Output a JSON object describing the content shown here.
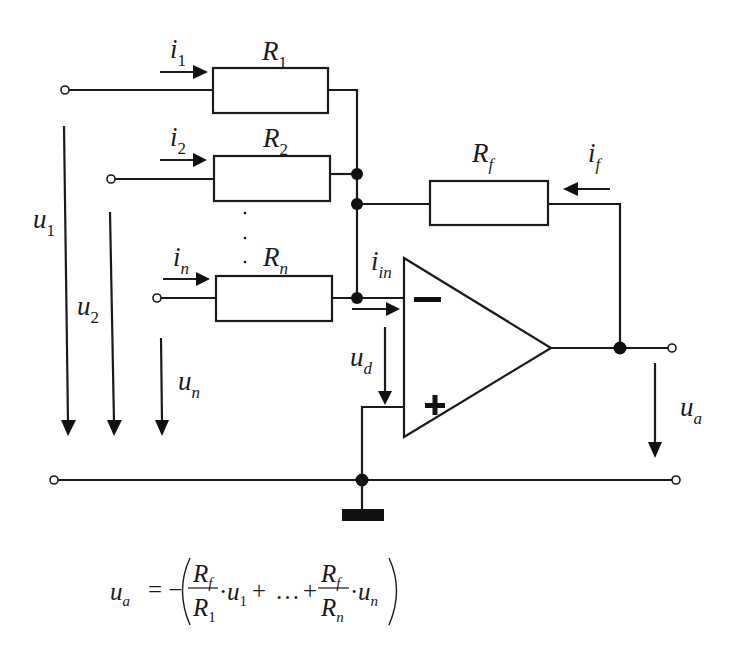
{
  "diagram": {
    "resistors": [
      {
        "id": "R1",
        "symbol": "R",
        "sub": "1",
        "current": "i",
        "current_sub": "1"
      },
      {
        "id": "R2",
        "symbol": "R",
        "sub": "2",
        "current": "i",
        "current_sub": "2"
      },
      {
        "id": "Rn",
        "symbol": "R",
        "sub": "n",
        "current": "i",
        "current_sub": "n"
      }
    ],
    "feedback": {
      "symbol": "R",
      "sub": "f",
      "current": "i",
      "current_sub": "f"
    },
    "input_current": {
      "symbol": "i",
      "sub": "in"
    },
    "voltages": [
      {
        "symbol": "u",
        "sub": "1"
      },
      {
        "symbol": "u",
        "sub": "2"
      },
      {
        "symbol": "u",
        "sub": "n"
      }
    ],
    "differential_voltage": {
      "symbol": "u",
      "sub": "d"
    },
    "output_voltage": {
      "symbol": "u",
      "sub": "a"
    },
    "opamp": {
      "minus": "−",
      "plus": "+"
    },
    "ellipsis_dots": "⋮"
  },
  "formula": {
    "lhs": "u",
    "lhs_sub": "a",
    "equals": "= −",
    "term1_num": "R",
    "term1_num_sub": "f",
    "term1_den": "R",
    "term1_den_sub": "1",
    "term1_var": "u",
    "term1_var_sub": "1",
    "plus1": "+",
    "ellipsis": "…",
    "plus2": "+",
    "termn_num": "R",
    "termn_num_sub": "f",
    "termn_den": "R",
    "termn_den_sub": "n",
    "termn_var": "u",
    "termn_var_sub": "n",
    "dot": "·"
  }
}
